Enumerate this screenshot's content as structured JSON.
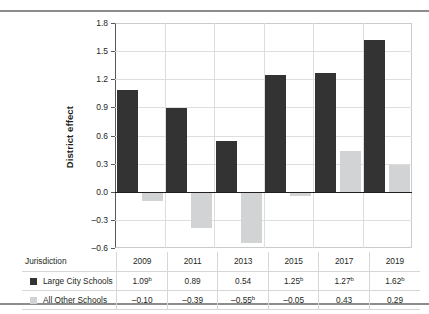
{
  "chart_data": {
    "type": "bar",
    "title": "",
    "xlabel": "",
    "ylabel": "District effect",
    "ylim": [
      -0.6,
      1.8
    ],
    "yticks": [
      "1.8",
      "1.5",
      "1.2",
      "0.9",
      "0.6",
      "0.3",
      "0.0",
      "–0.3",
      "–0.6"
    ],
    "ytick_values": [
      1.8,
      1.5,
      1.2,
      0.9,
      0.6,
      0.3,
      0.0,
      -0.3,
      -0.6
    ],
    "grid": "horizontal-and-vertical",
    "legend_position": "table-left",
    "categories": [
      "2009",
      "2011",
      "2013",
      "2015",
      "2017",
      "2019"
    ],
    "series": [
      {
        "name": "Large City Schools",
        "color": "#333333",
        "values": [
          1.09,
          0.89,
          0.54,
          1.25,
          1.27,
          1.62
        ],
        "labels": [
          "1.09",
          "0.89",
          "0.54",
          "1.25",
          "1.27",
          "1.62"
        ],
        "superscripts": [
          "b",
          "",
          "",
          "b",
          "b",
          "b"
        ]
      },
      {
        "name": "All Other Schools",
        "color": "#d2d3d5",
        "values": [
          -0.1,
          -0.39,
          -0.55,
          -0.05,
          0.43,
          0.29
        ],
        "labels": [
          "–0.10",
          "–0.39",
          "–0.55",
          "–0.05",
          "0.43",
          "0.29"
        ],
        "superscripts": [
          "",
          "",
          "b",
          "",
          "",
          ""
        ]
      }
    ]
  },
  "axis": {
    "y_title": "District effect"
  },
  "table": {
    "row_header_label": "Jurisdiction"
  }
}
